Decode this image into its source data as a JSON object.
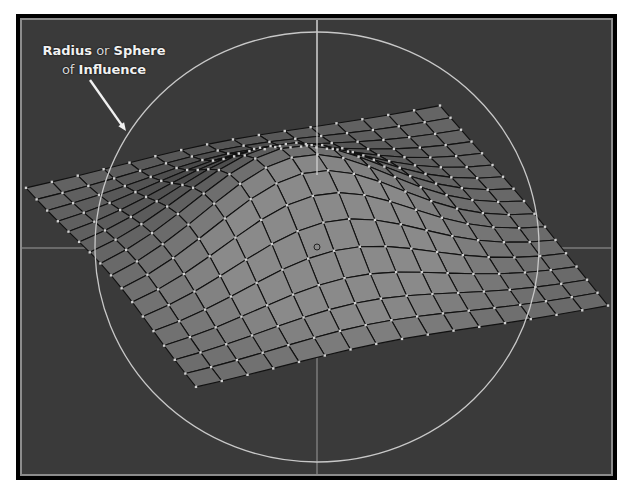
{
  "annotation": {
    "line1": {
      "bold1": "Radius",
      "normal": " or ",
      "bold2": "Sphere"
    },
    "line2": {
      "normal": "of ",
      "bold": "Influence"
    },
    "arrow": {
      "from": [
        90,
        80
      ],
      "to": [
        126,
        131
      ]
    }
  },
  "viewport": {
    "background": "#3a3a3a",
    "frame_outer": "#000000",
    "frame_inner": "#8c8c8c"
  },
  "axes": {
    "color": "#9a9a9a",
    "vertical_x": 317,
    "vertical_top_y": 20,
    "vertical_peak_y": 175,
    "horizontal_y": 248
  },
  "sphere_of_influence": {
    "center": [
      317,
      247
    ],
    "rx": 222,
    "ry": 215,
    "color": "#c8c8c8"
  },
  "mesh": {
    "divisions": 16,
    "corners": {
      "left": [
        26,
        189
      ],
      "top": [
        440,
        106
      ],
      "right": [
        608,
        306
      ],
      "bottom": [
        196,
        388
      ]
    },
    "bump_height": 95,
    "bump_center": [
      0.45,
      0.5
    ],
    "bump_radius": 0.32,
    "edge_color": "#111111",
    "vertex_color": "#d0d0d0",
    "face_light": "#8a8a8a",
    "face_dark": "#4a4a4a"
  },
  "pivot_marker": {
    "position": [
      317,
      247
    ],
    "radius": 3
  }
}
